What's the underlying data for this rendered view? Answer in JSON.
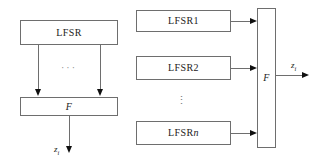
{
  "diagram": {
    "left": {
      "name": "single-lfsr-filter-generator",
      "lfsr": {
        "label": "LFSR"
      },
      "combiner": {
        "label": "F"
      },
      "tap_ellipsis": "···",
      "output": {
        "symbol": "z",
        "subscript": "i"
      },
      "tap_count_shown": 2
    },
    "right": {
      "name": "multiple-lfsr-combination-generator",
      "registers": [
        {
          "label": "LFSR",
          "index": "1"
        },
        {
          "label": "LFSR",
          "index": "2"
        },
        {
          "label": "LFSR",
          "index": "n"
        }
      ],
      "register_ellipsis": "⋮",
      "combiner": {
        "label": "F"
      },
      "output": {
        "symbol": "z",
        "subscript": "i"
      }
    }
  },
  "colors": {
    "stroke": "#6e6e6e",
    "arrowhead": "#101010",
    "text": "#1b1b1b",
    "ellipsis": "#8a8a8a",
    "background": "#ffffff"
  }
}
